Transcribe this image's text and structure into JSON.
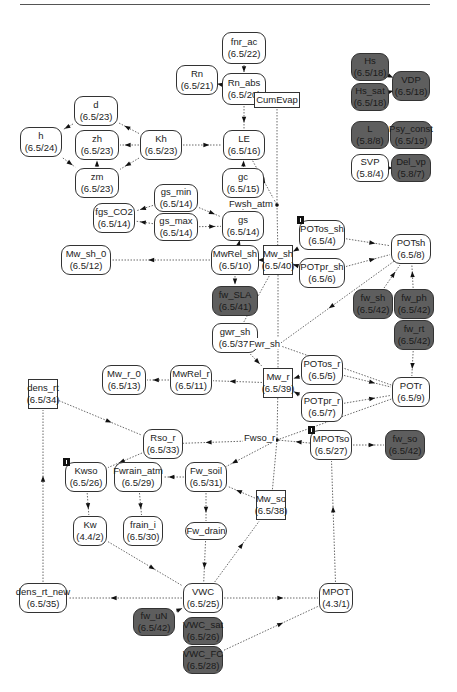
{
  "nodes": {
    "fnr_ac": {
      "name": "fnr_ac",
      "code": "(6.5/22)"
    },
    "Rn": {
      "name": "Rn",
      "code": "(6.5/21)"
    },
    "Rn_abs": {
      "name": "Rn_abs",
      "code": "(6.5/20)"
    },
    "d": {
      "name": "d",
      "code": "(6.5/23)"
    },
    "zh": {
      "name": "zh",
      "code": "(6.5/23)"
    },
    "zm": {
      "name": "zm",
      "code": "(6.5/23)"
    },
    "h": {
      "name": "h",
      "code": "(6.5/24)"
    },
    "Kh": {
      "name": "Kh",
      "code": "(6.5/23)"
    },
    "LE": {
      "name": "LE",
      "code": "(6.5/16)"
    },
    "CumEvap": {
      "name": "CumEvap",
      "code": ""
    },
    "gc": {
      "name": "gc",
      "code": "(6.5/15)"
    },
    "gs_min": {
      "name": "gs_min",
      "code": "(6.5/14)"
    },
    "gs_max": {
      "name": "gs_max",
      "code": "(6.5/14)"
    },
    "fgs_CO2": {
      "name": "fgs_CO2",
      "code": "(6.5/14)"
    },
    "gs": {
      "name": "gs",
      "code": "(6.5/14)"
    },
    "Mw_sh_0": {
      "name": "Mw_sh_0",
      "code": "(6.5/12)"
    },
    "MwRel_sh": {
      "name": "MwRel_sh",
      "code": "(6.5/10)"
    },
    "Mw_sh": {
      "name": "Mw_sh",
      "code": "(6.5/40)"
    },
    "fw_SLA": {
      "name": "fw_SLA",
      "code": "(6.5/41)"
    },
    "gwr_sh": {
      "name": "gwr_sh",
      "code": "(6.5/37)"
    },
    "POTos_sh": {
      "name": "POTos_sh",
      "code": "(6.5/4)"
    },
    "POTpr_sh": {
      "name": "POTpr_sh",
      "code": "(6.5/6)"
    },
    "POTsh": {
      "name": "POTsh",
      "code": "(6.5/8)"
    },
    "fw_sh": {
      "name": "fw_sh",
      "code": "(6.5/42)"
    },
    "fw_ph": {
      "name": "fw_ph",
      "code": "(6.5/42)"
    },
    "fw_rt": {
      "name": "fw_rt",
      "code": "(6.5/42)"
    },
    "Hs": {
      "name": "Hs",
      "code": "(6.5/18)"
    },
    "Hs_sat": {
      "name": "Hs_sat",
      "code": "(6.5/18)"
    },
    "VDP": {
      "name": "VDP",
      "code": "(6.5/18)"
    },
    "L": {
      "name": "L",
      "code": "(5.8/8)"
    },
    "Psy_const": {
      "name": "Psy_const",
      "code": "(6.5/19)"
    },
    "SVP": {
      "name": "SVP",
      "code": "(5.8/4)"
    },
    "Del_vp": {
      "name": "Del_vp",
      "code": "(5.8/7)"
    },
    "Mw_r_0": {
      "name": "Mw_r_0",
      "code": "(6.5/13)"
    },
    "MwRel_r": {
      "name": "MwRel_r",
      "code": "(6.5/11)"
    },
    "Mw_r": {
      "name": "Mw_r",
      "code": "(6.5/39)"
    },
    "POTos_r": {
      "name": "POTos_r",
      "code": "(6.5/5)"
    },
    "POTpr_r": {
      "name": "POTpr_r",
      "code": "(6.5/7)"
    },
    "POTr": {
      "name": "POTr",
      "code": "(6.5/9)"
    },
    "dens_rt": {
      "name": "dens_rt",
      "code": "(6.5/34)"
    },
    "Rso_r": {
      "name": "Rso_r",
      "code": "(6.5/33)"
    },
    "MPOTso": {
      "name": "MPOTso",
      "code": "(6.5/27)"
    },
    "fw_so": {
      "name": "fw_so",
      "code": "(6.5/42)"
    },
    "Kwso": {
      "name": "Kwso",
      "code": "(6.5/26)"
    },
    "Fwrain_atm": {
      "name": "Fwrain_atm",
      "code": "(6.5/29)"
    },
    "Fw_soil": {
      "name": "Fw_soil",
      "code": "(6.5/31)"
    },
    "Mw_so": {
      "name": "Mw_so",
      "code": "(6.5/38)"
    },
    "Kw": {
      "name": "Kw",
      "code": "(4.4/2)"
    },
    "frain_i": {
      "name": "frain_i",
      "code": "(6.5/30)"
    },
    "Fw_drain": {
      "name": "Fw_drain",
      "code": ""
    },
    "dens_rt_new": {
      "name": "dens_rt_new",
      "code": "(6.5/35)"
    },
    "VWC": {
      "name": "VWC",
      "code": "(6.5/25)"
    },
    "fw_uN": {
      "name": "fw_uN",
      "code": "(6.5/42)"
    },
    "VWC_sat": {
      "name": "VWC_sat",
      "code": "(6.5/26)"
    },
    "VWC_FC": {
      "name": "VWC_FC",
      "code": "(6.5/28)"
    },
    "MPOT": {
      "name": "MPOT",
      "code": "(4.3/1)"
    }
  },
  "flow_labels": {
    "Fwsh_atm": "Fwsh_atm",
    "Fwr_sh": "Fwr_sh",
    "Fwso_r": "Fwso_r"
  }
}
